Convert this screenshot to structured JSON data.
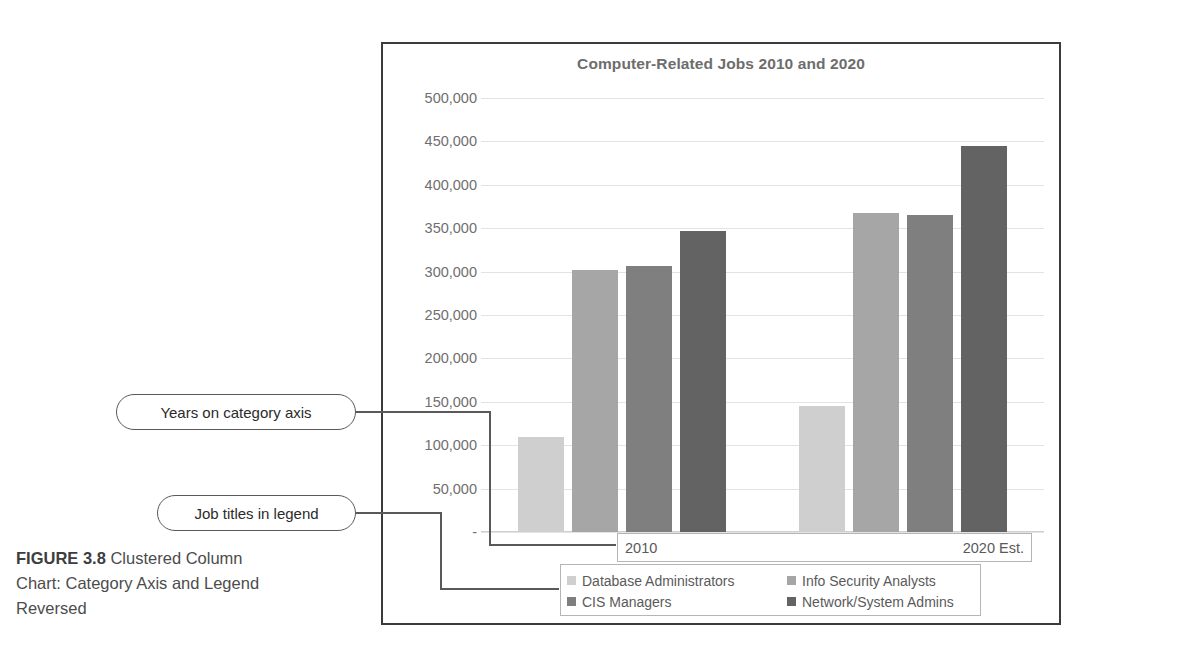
{
  "figure": {
    "number_label": "FIGURE 3.8",
    "caption": " Clustered Column Chart: Category Axis and Legend Reversed"
  },
  "callouts": {
    "years": "Years on category axis",
    "legend": "Job titles in legend"
  },
  "colors": {
    "series": [
      "#cfcfcf",
      "#a6a6a6",
      "#7f7f7f",
      "#636363"
    ],
    "frame": "#3b3b3b",
    "gridline": "#e3e3e3",
    "text": "#6f6f6f",
    "callout_border": "#595959"
  },
  "chart_data": {
    "type": "bar",
    "title": "Computer-Related Jobs 2010 and 2020",
    "xlabel": "",
    "ylabel": "",
    "grid": true,
    "legend_position": "bottom",
    "categories": [
      "2010",
      "2020 Est."
    ],
    "ylim": [
      0,
      500000
    ],
    "ytick_labels": [
      "500,000",
      "450,000",
      "400,000",
      "350,000",
      "300,000",
      "250,000",
      "200,000",
      "150,000",
      "100,000",
      "50,000",
      "-"
    ],
    "ytick_values": [
      500000,
      450000,
      400000,
      350000,
      300000,
      250000,
      200000,
      150000,
      100000,
      50000,
      0
    ],
    "series": [
      {
        "name": "Database Administrators",
        "color": "#cfcfcf",
        "values": [
          110000,
          145000
        ]
      },
      {
        "name": "Info Security Analysts",
        "color": "#a6a6a6",
        "values": [
          302000,
          368000
        ]
      },
      {
        "name": "CIS Managers",
        "color": "#7f7f7f",
        "values": [
          307000,
          365000
        ]
      },
      {
        "name": "Network/System Admins",
        "color": "#636363",
        "values": [
          347000,
          445000
        ]
      }
    ]
  }
}
